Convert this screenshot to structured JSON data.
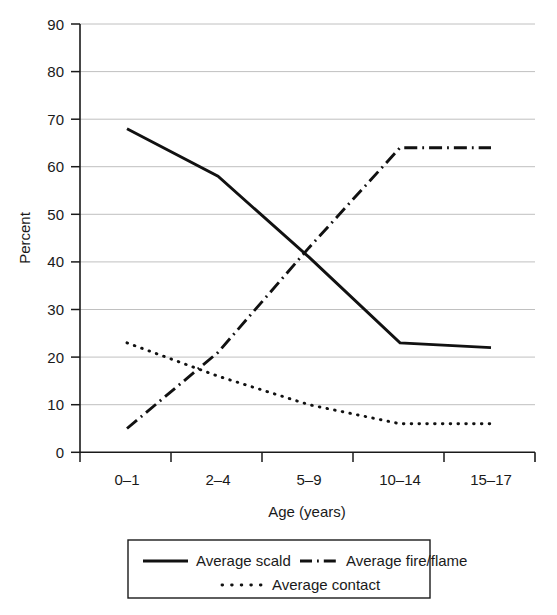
{
  "chart_data": {
    "type": "line",
    "title": "",
    "xlabel": "Age (years)",
    "ylabel": "Percent",
    "categories": [
      "0–1",
      "2–4",
      "5–9",
      "10–14",
      "15–17"
    ],
    "ylim": [
      0,
      90
    ],
    "yticks": [
      0,
      10,
      20,
      30,
      40,
      50,
      60,
      70,
      80,
      90
    ],
    "ytick_labels": [
      "0",
      "10",
      "20",
      "30",
      "40",
      "50",
      "60",
      "70",
      "80",
      "90"
    ],
    "grid": true,
    "legend_position": "bottom",
    "series": [
      {
        "name": "Average scald",
        "style": "solid",
        "color": "#111111",
        "values": [
          68,
          58,
          41,
          23,
          22
        ]
      },
      {
        "name": "Average fire/flame",
        "style": "dash-dot",
        "color": "#111111",
        "values": [
          5,
          21,
          43,
          64,
          64
        ]
      },
      {
        "name": "Average contact",
        "style": "dotted",
        "color": "#111111",
        "values": [
          23,
          16,
          10,
          6,
          6
        ]
      }
    ]
  },
  "axes": {
    "y_title": "Percent",
    "x_title": "Age (years)",
    "y_tick_labels": [
      "90",
      "80",
      "70",
      "60",
      "50",
      "40",
      "30",
      "20",
      "10",
      "0"
    ],
    "x_tick_labels": [
      "0–1",
      "2–4",
      "5–9",
      "10–14",
      "15–17"
    ]
  },
  "legend": {
    "entries": [
      {
        "label": "Average scald",
        "style": "solid"
      },
      {
        "label": "Average fire/flame",
        "style": "dash-dot"
      },
      {
        "label": "Average contact",
        "style": "dotted"
      }
    ]
  },
  "colors": {
    "ink": "#111111",
    "grid": "#b9b9b9",
    "background": "#ffffff"
  }
}
